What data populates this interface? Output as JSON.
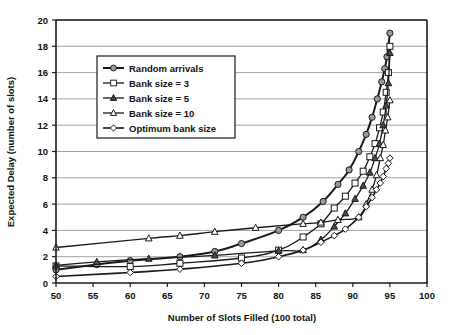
{
  "chart_data": {
    "type": "line",
    "title": "",
    "xlabel": "Number of Slots Filled (100 total)",
    "ylabel": "Expected Delay (number of slots)",
    "xlim": [
      50,
      100
    ],
    "ylim": [
      0,
      20
    ],
    "xticks": [
      50,
      55,
      60,
      65,
      70,
      75,
      80,
      85,
      90,
      95,
      100
    ],
    "yticks": [
      0,
      2,
      4,
      6,
      8,
      10,
      12,
      14,
      16,
      18,
      20
    ],
    "xtick_labels": [
      "50",
      "55",
      "60",
      "65",
      "70",
      "75",
      "80",
      "85",
      "90",
      "95",
      "100"
    ],
    "ytick_labels": [
      "0",
      "2",
      "4",
      "6",
      "8",
      "10",
      "12",
      "14",
      "16",
      "18",
      "20"
    ],
    "grid": "horizontal",
    "legend_position": "upper-left-inside",
    "series": [
      {
        "name": "Random arrivals",
        "marker": "filled-circle",
        "color": "#1a1a1a",
        "marker_fill": "#9a9a9a",
        "line_width": 2.0,
        "points": [
          [
            50.0,
            1.0
          ],
          [
            55.5,
            1.4
          ],
          [
            60.0,
            1.7
          ],
          [
            66.7,
            2.0
          ],
          [
            71.4,
            2.4
          ],
          [
            75.0,
            3.0
          ],
          [
            80.0,
            4.0
          ],
          [
            83.3,
            5.0
          ],
          [
            86.0,
            6.2
          ],
          [
            88.0,
            7.5
          ],
          [
            89.5,
            8.6
          ],
          [
            90.8,
            10.0
          ],
          [
            91.8,
            11.3
          ],
          [
            92.6,
            12.6
          ],
          [
            93.3,
            14.0
          ],
          [
            93.9,
            15.3
          ],
          [
            94.3,
            16.3
          ],
          [
            94.6,
            17.2
          ],
          [
            95.0,
            19.0
          ]
        ]
      },
      {
        "name": "Bank size = 3",
        "marker": "open-square",
        "color": "#1a1a1a",
        "marker_fill": "#ffffff",
        "line_width": 1.3,
        "points": [
          [
            50.0,
            1.3
          ],
          [
            60.0,
            1.25
          ],
          [
            66.7,
            1.5
          ],
          [
            75.0,
            1.9
          ],
          [
            80.0,
            2.5
          ],
          [
            83.3,
            3.5
          ],
          [
            85.7,
            4.5
          ],
          [
            87.5,
            5.7
          ],
          [
            89.0,
            6.6
          ],
          [
            90.3,
            7.6
          ],
          [
            91.4,
            8.5
          ],
          [
            92.3,
            9.6
          ],
          [
            93.0,
            10.6
          ],
          [
            93.6,
            11.8
          ],
          [
            94.1,
            13.0
          ],
          [
            94.5,
            14.5
          ],
          [
            94.8,
            16.0
          ],
          [
            95.0,
            18.0
          ]
        ]
      },
      {
        "name": "Bank size = 5",
        "marker": "filled-triangle",
        "color": "#1a1a1a",
        "marker_fill": "#4a4a4a",
        "line_width": 1.3,
        "points": [
          [
            50.0,
            1.35
          ],
          [
            55.5,
            1.6
          ],
          [
            62.5,
            1.85
          ],
          [
            71.4,
            2.1
          ],
          [
            80.0,
            2.45
          ],
          [
            83.3,
            2.5
          ],
          [
            85.7,
            3.3
          ],
          [
            87.5,
            4.3
          ],
          [
            89.0,
            5.3
          ],
          [
            90.3,
            6.4
          ],
          [
            91.4,
            7.4
          ],
          [
            92.3,
            8.4
          ],
          [
            93.0,
            9.5
          ],
          [
            93.6,
            10.6
          ],
          [
            94.1,
            12.0
          ],
          [
            94.5,
            13.5
          ],
          [
            94.8,
            15.2
          ],
          [
            95.0,
            17.5
          ]
        ]
      },
      {
        "name": "Bank size = 10",
        "marker": "open-triangle",
        "color": "#1a1a1a",
        "marker_fill": "#ffffff",
        "line_width": 1.3,
        "points": [
          [
            50.0,
            2.7
          ],
          [
            62.5,
            3.4
          ],
          [
            66.7,
            3.6
          ],
          [
            71.4,
            3.9
          ],
          [
            76.9,
            4.2
          ],
          [
            83.3,
            4.5
          ],
          [
            85.7,
            4.6
          ],
          [
            88.0,
            4.8
          ],
          [
            90.8,
            5.0
          ],
          [
            91.8,
            6.0
          ],
          [
            92.6,
            7.1
          ],
          [
            93.2,
            8.2
          ],
          [
            93.7,
            9.5
          ],
          [
            94.1,
            10.5
          ],
          [
            94.4,
            11.6
          ],
          [
            94.7,
            12.6
          ],
          [
            95.0,
            13.9
          ]
        ]
      },
      {
        "name": "Optimum bank size",
        "marker": "open-diamond",
        "color": "#1a1a1a",
        "marker_fill": "#ffffff",
        "line_width": 1.6,
        "points": [
          [
            50.0,
            0.5
          ],
          [
            60.0,
            0.8
          ],
          [
            66.7,
            1.05
          ],
          [
            75.0,
            1.5
          ],
          [
            80.0,
            2.0
          ],
          [
            83.3,
            2.5
          ],
          [
            85.7,
            3.1
          ],
          [
            87.5,
            3.6
          ],
          [
            89.0,
            4.1
          ],
          [
            90.8,
            5.0
          ],
          [
            91.8,
            5.8
          ],
          [
            92.6,
            6.5
          ],
          [
            93.2,
            7.1
          ],
          [
            93.7,
            7.6
          ],
          [
            94.1,
            8.1
          ],
          [
            94.5,
            8.7
          ],
          [
            94.8,
            9.1
          ],
          [
            95.0,
            9.5
          ]
        ]
      }
    ],
    "legend_entries": [
      "Random arrivals",
      "Bank size = 3",
      "Bank size = 5",
      "Bank size = 10",
      "Optimum bank size"
    ]
  },
  "colors": {
    "axis": "#1a1a1a",
    "grid": "#8a8a8a",
    "background": "#ffffff",
    "text": "#111111"
  }
}
